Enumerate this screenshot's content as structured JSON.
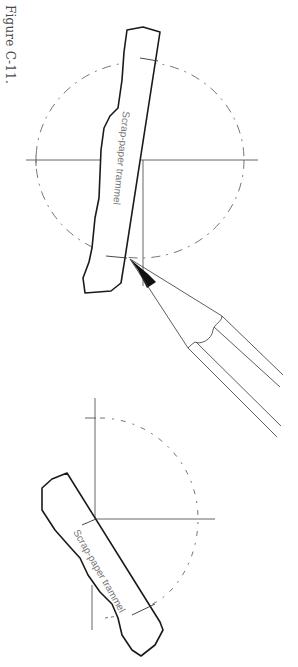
{
  "figure": {
    "label": "Figure C-11.",
    "upper_diagram": {
      "trammel_label": "Scrap-paper trammel",
      "tool": "pencil"
    },
    "lower_diagram": {
      "trammel_label": "Scrap-paper trammel"
    }
  },
  "colors": {
    "ink": "#1a1a1a",
    "thin_line": "#555555",
    "dashed": "#666666",
    "label_text": "#777777"
  }
}
